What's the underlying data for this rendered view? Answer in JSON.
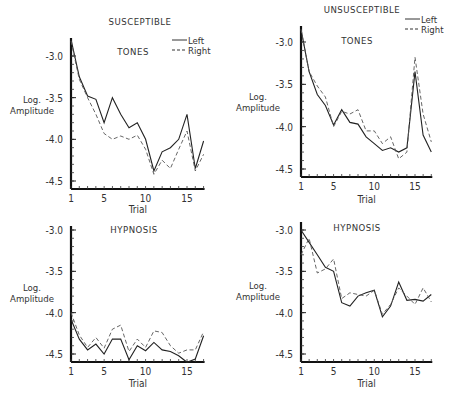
{
  "chart_data": [
    {
      "type": "line",
      "panel": "top-left",
      "group_title": "SUSCEPTIBLE",
      "title": "TONES",
      "xlabel": "Trial",
      "ylabel": [
        "Log.",
        "Amplitude"
      ],
      "ylim": [
        -4.6,
        -2.8
      ],
      "xlim": [
        1,
        17
      ],
      "yticks": [
        -3.0,
        -3.5,
        -4.0,
        -4.5
      ],
      "ytick_labels": [
        "-3.0",
        "-3.5",
        "-4.0",
        "-4.5"
      ],
      "xticks": [
        1,
        5,
        10,
        15
      ],
      "xtick_labels": [
        "1",
        "5",
        "10",
        "15"
      ],
      "legend": {
        "entries": [
          "Left",
          "Right"
        ],
        "placement": "top-right"
      },
      "x": [
        1,
        2,
        3,
        4,
        5,
        6,
        7,
        8,
        9,
        10,
        11,
        12,
        13,
        14,
        15,
        16,
        17
      ],
      "series": [
        {
          "name": "Left",
          "style": "solid",
          "values": [
            -2.8,
            -3.25,
            -3.48,
            -3.52,
            -3.8,
            -3.5,
            -3.7,
            -3.86,
            -3.8,
            -4.0,
            -4.38,
            -4.15,
            -4.1,
            -4.0,
            -3.7,
            -4.35,
            -4.02
          ]
        },
        {
          "name": "Right",
          "style": "dashed",
          "values": [
            -2.82,
            -3.28,
            -3.5,
            -3.7,
            -3.93,
            -4.0,
            -3.96,
            -4.0,
            -3.95,
            -4.12,
            -4.42,
            -4.25,
            -4.35,
            -4.12,
            -3.9,
            -4.38,
            -4.18
          ]
        }
      ]
    },
    {
      "type": "line",
      "panel": "top-right",
      "group_title": "UNSUSCEPTIBLE",
      "title": "TONES",
      "xlabel": "Trial",
      "ylabel": [
        "Log.",
        "Amplitude"
      ],
      "ylim": [
        -4.6,
        -2.8
      ],
      "xlim": [
        1,
        17
      ],
      "yticks": [
        -3.0,
        -3.5,
        -4.0,
        -4.5
      ],
      "ytick_labels": [
        "-3.0",
        "-3.5",
        "-4.0",
        "-4.5"
      ],
      "xticks": [
        1,
        5,
        10,
        15
      ],
      "xtick_labels": [
        "1",
        "5",
        "10",
        "15"
      ],
      "legend": {
        "entries": [
          "Left",
          "Right"
        ],
        "placement": "top-right"
      },
      "x": [
        1,
        2,
        3,
        4,
        5,
        6,
        7,
        8,
        9,
        10,
        11,
        12,
        13,
        14,
        15,
        16,
        17
      ],
      "series": [
        {
          "name": "Left",
          "style": "solid",
          "values": [
            -2.85,
            -3.35,
            -3.62,
            -3.75,
            -3.98,
            -3.8,
            -3.95,
            -3.97,
            -4.12,
            -4.2,
            -4.28,
            -4.25,
            -4.3,
            -4.25,
            -3.35,
            -4.1,
            -4.3
          ]
        },
        {
          "name": "Right",
          "style": "dashed",
          "values": [
            -2.85,
            -3.35,
            -3.52,
            -3.65,
            -4.0,
            -3.82,
            -3.85,
            -3.8,
            -4.05,
            -4.05,
            -4.2,
            -4.12,
            -4.38,
            -4.3,
            -3.18,
            -3.85,
            -4.18
          ]
        }
      ]
    },
    {
      "type": "line",
      "panel": "bottom-left",
      "title": "HYPNOSIS",
      "xlabel": "Trial",
      "ylabel": [
        "Log.",
        "Amplitude"
      ],
      "ylim": [
        -4.6,
        -3.0
      ],
      "xlim": [
        1,
        17
      ],
      "yticks": [
        -3.0,
        -3.5,
        -4.0,
        -4.5
      ],
      "ytick_labels": [
        "-3.0",
        "-3.5",
        "-4.0",
        "-4.5"
      ],
      "xticks": [
        1,
        5,
        10,
        15
      ],
      "xtick_labels": [
        "1",
        "5",
        "10",
        "15"
      ],
      "x": [
        1,
        2,
        3,
        4,
        5,
        6,
        7,
        8,
        9,
        10,
        11,
        12,
        13,
        14,
        15,
        16,
        17
      ],
      "series": [
        {
          "name": "Left",
          "style": "solid",
          "values": [
            -4.08,
            -4.32,
            -4.45,
            -4.38,
            -4.5,
            -4.32,
            -4.32,
            -4.57,
            -4.4,
            -4.46,
            -4.36,
            -4.45,
            -4.47,
            -4.52,
            -4.6,
            -4.56,
            -4.28
          ]
        },
        {
          "name": "Right",
          "style": "dashed",
          "values": [
            -4.0,
            -4.27,
            -4.42,
            -4.3,
            -4.43,
            -4.2,
            -4.15,
            -4.47,
            -4.32,
            -4.42,
            -4.22,
            -4.24,
            -4.4,
            -4.49,
            -4.45,
            -4.45,
            -4.23
          ]
        }
      ]
    },
    {
      "type": "line",
      "panel": "bottom-right",
      "title": "HYPNOSIS",
      "xlabel": "Trial",
      "ylabel": [
        "Log.",
        "Amplitude"
      ],
      "ylim": [
        -4.6,
        -2.95
      ],
      "xlim": [
        1,
        17
      ],
      "yticks": [
        -3.0,
        -3.5,
        -4.0,
        -4.5
      ],
      "ytick_labels": [
        "-3.0",
        "-3.5",
        "-4.0",
        "-4.5"
      ],
      "xticks": [
        1,
        5,
        10,
        15
      ],
      "xtick_labels": [
        "1",
        "5",
        "10",
        "15"
      ],
      "x": [
        1,
        2,
        3,
        4,
        5,
        6,
        7,
        8,
        9,
        10,
        11,
        12,
        13,
        14,
        15,
        16,
        17
      ],
      "series": [
        {
          "name": "Left",
          "style": "solid",
          "values": [
            -3.0,
            -3.15,
            -3.3,
            -3.45,
            -3.5,
            -3.88,
            -3.92,
            -3.8,
            -3.76,
            -3.73,
            -4.05,
            -3.92,
            -3.63,
            -3.85,
            -3.84,
            -3.86,
            -3.78
          ]
        },
        {
          "name": "Right",
          "style": "dashed",
          "values": [
            -3.3,
            -3.1,
            -3.52,
            -3.47,
            -3.35,
            -3.83,
            -3.76,
            -3.78,
            -3.8,
            -3.73,
            -4.02,
            -3.9,
            -3.7,
            -3.8,
            -3.9,
            -3.7,
            -3.87
          ]
        }
      ]
    }
  ]
}
